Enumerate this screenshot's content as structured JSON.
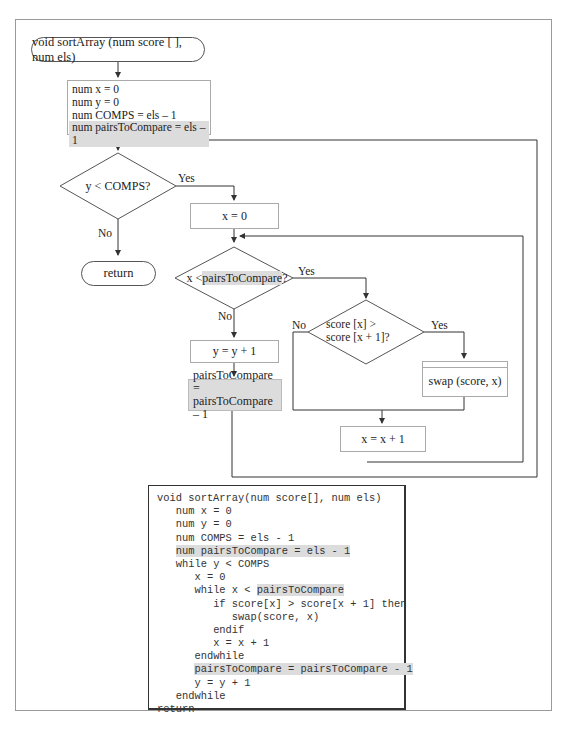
{
  "flowchart": {
    "start_terminal": "void sortArray (num score [ ], num els)",
    "init_lines": [
      "num x = 0",
      "num y = 0",
      "num COMPS = els  – 1",
      "num pairsToCompare = els – 1"
    ],
    "outer_decision": "y < COMPS?",
    "outer_yes": "Yes",
    "outer_no": "No",
    "return_terminal": "return",
    "reset_x": "x = 0",
    "inner_decision_prefix": "x  <",
    "inner_decision_highlight": "pairsToCompare",
    "inner_decision_suffix": "?",
    "inner_yes": "Yes",
    "inner_no": "No",
    "compare_decision_line1": "score [x] >",
    "compare_decision_line2": "score [x + 1]?",
    "compare_yes": "Yes",
    "compare_no": "No",
    "swap_process": "swap (score, x)",
    "increment_x": "x = x + 1",
    "increment_y": "y = y + 1",
    "decrement_pairs_line1": "pairsToCompare =",
    "decrement_pairs_line2": "pairsToCompare – 1"
  },
  "pseudocode": {
    "lines": [
      {
        "indent": "",
        "text": "void sortArray(num score[], num els)",
        "highlight": ""
      },
      {
        "indent": "   ",
        "text": "num x = 0",
        "highlight": ""
      },
      {
        "indent": "   ",
        "text": "num y = 0",
        "highlight": ""
      },
      {
        "indent": "   ",
        "text": "num COMPS = els - 1",
        "highlight": ""
      },
      {
        "indent": "   ",
        "text": "",
        "highlight": "num pairsToCompare = els - 1"
      },
      {
        "indent": "   ",
        "text": "while y < COMPS",
        "highlight": ""
      },
      {
        "indent": "      ",
        "text": "x = 0",
        "highlight": ""
      },
      {
        "indent": "      ",
        "text": "while x < ",
        "highlight": "pairsToCompare"
      },
      {
        "indent": "         ",
        "text": "if score[x] > score[x + 1] then",
        "highlight": ""
      },
      {
        "indent": "            ",
        "text": "swap(score, x)",
        "highlight": ""
      },
      {
        "indent": "         ",
        "text": "endif",
        "highlight": ""
      },
      {
        "indent": "         ",
        "text": "x = x + 1",
        "highlight": ""
      },
      {
        "indent": "      ",
        "text": "endwhile",
        "highlight": ""
      },
      {
        "indent": "      ",
        "text": "",
        "highlight": "pairsToCompare = pairsToCompare - 1"
      },
      {
        "indent": "      ",
        "text": "y = y + 1",
        "highlight": ""
      },
      {
        "indent": "   ",
        "text": "endwhile",
        "highlight": ""
      },
      {
        "indent": "",
        "text": "return",
        "highlight": ""
      }
    ]
  },
  "colors": {
    "highlight": "#dcdcdc",
    "line": "#333333",
    "frame": "#9a9a9a"
  }
}
